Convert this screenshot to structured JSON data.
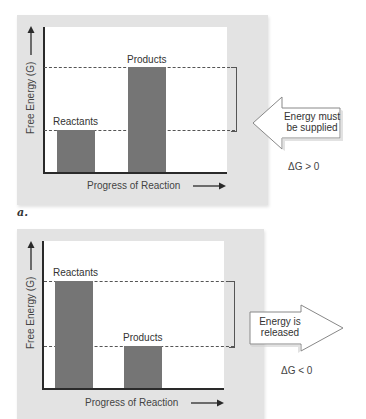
{
  "colors": {
    "panel": "#e3e3e3",
    "plot": "#ffffff",
    "bar": "#757575",
    "axis": "#2a2a2a"
  },
  "panel_a": {
    "ylabel": "Free Energy (G)",
    "xlabel": "Progress of Reaction",
    "bars": [
      {
        "label": "Reactants",
        "level": "low"
      },
      {
        "label": "Products",
        "level": "high"
      }
    ],
    "callout": {
      "line1": "Energy must",
      "line2": "be supplied",
      "direction": "left"
    },
    "delta_g": "ΔG > 0",
    "sublabel": "a."
  },
  "panel_b": {
    "ylabel": "Free Energy (G)",
    "xlabel": "Progress of Reaction",
    "bars": [
      {
        "label": "Reactants",
        "level": "high"
      },
      {
        "label": "Products",
        "level": "low"
      }
    ],
    "callout": {
      "line1": "Energy is",
      "line2": "released",
      "direction": "right"
    },
    "delta_g": "ΔG < 0"
  }
}
